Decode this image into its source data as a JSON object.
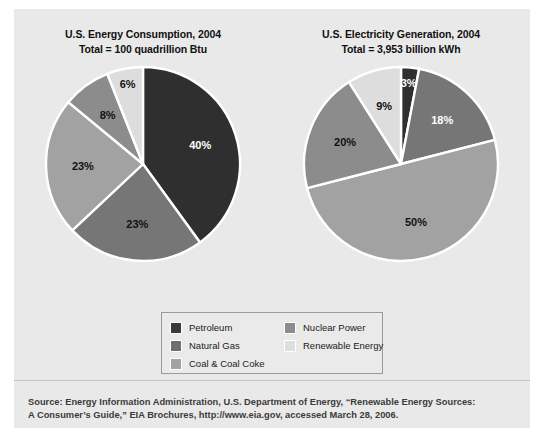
{
  "figure": {
    "background_color": "#e9e9e9",
    "page_color": "#ffffff"
  },
  "charts": [
    {
      "title": "U.S. Energy Consumption, 2004",
      "subtitle": "Total = 100 quadrillion Btu"
    },
    {
      "title": "U.S. Electricity Generation, 2004",
      "subtitle": "Total = 3,953 billion kWh"
    }
  ],
  "legend": {
    "items": [
      {
        "label": "Petroleum",
        "color": "#3a3a3a"
      },
      {
        "label": "Natural Gas",
        "color": "#6f6f6f"
      },
      {
        "label": "Coal & Coal Coke",
        "color": "#a2a2a2"
      },
      {
        "label": "Nuclear Power",
        "color": "#8c8c8c"
      },
      {
        "label": "Renewable Energy",
        "color": "#dedede"
      }
    ]
  },
  "source": {
    "line1": "Source: Energy Information Administration, U.S. Department of Energy, “Renewable Energy Sources:",
    "line2": "A Consumer’s Guide,” EIA Brochures, http://www.eia.gov, accessed March 28, 2006."
  },
  "chart_data": [
    {
      "type": "pie",
      "title": "U.S. Energy Consumption, 2004",
      "subtitle": "Total = 100 quadrillion Btu",
      "total_label": "100 quadrillion Btu",
      "categories": [
        "Petroleum",
        "Natural Gas",
        "Coal & Coal Coke",
        "Nuclear Power",
        "Renewable Energy"
      ],
      "values": [
        40,
        23,
        23,
        8,
        6
      ],
      "value_labels": [
        "40%",
        "23%",
        "23%",
        "8%",
        "6%"
      ],
      "colors": [
        "#2f2f2f",
        "#767676",
        "#a2a2a2",
        "#8c8c8c",
        "#dddddd"
      ],
      "label_text_colors": [
        "#ffffff",
        "#111111",
        "#111111",
        "#111111",
        "#111111"
      ],
      "start_angle_deg": 0,
      "direction": "clockwise",
      "separator_color": "#ffffff",
      "legend_position": "bottom-center"
    },
    {
      "type": "pie",
      "title": "U.S. Electricity Generation, 2004",
      "subtitle": "Total = 3,953 billion kWh",
      "total_label": "3,953 billion kWh",
      "categories": [
        "Petroleum",
        "Natural Gas",
        "Coal & Coal Coke",
        "Nuclear Power",
        "Renewable Energy"
      ],
      "values": [
        3,
        18,
        50,
        20,
        9
      ],
      "value_labels": [
        "3%",
        "18%",
        "50%",
        "20%",
        "9%"
      ],
      "colors": [
        "#2f2f2f",
        "#767676",
        "#a2a2a2",
        "#8c8c8c",
        "#dddddd"
      ],
      "label_text_colors": [
        "#ffffff",
        "#ffffff",
        "#111111",
        "#111111",
        "#111111"
      ],
      "start_angle_deg": 0,
      "direction": "clockwise",
      "separator_color": "#ffffff",
      "legend_position": "bottom-center"
    }
  ]
}
